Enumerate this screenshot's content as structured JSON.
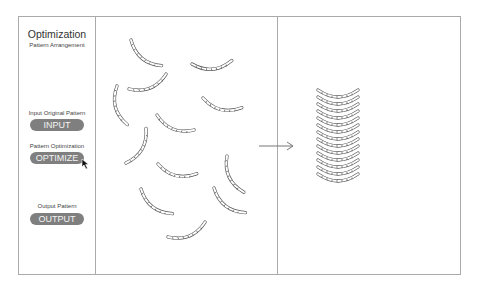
{
  "sidebar": {
    "title": "Optimization",
    "subtitle": "Pattern Arrangement",
    "steps": [
      {
        "label": "Input Original Pattern",
        "button": "INPUT"
      },
      {
        "label": "Pattern Optimization",
        "button": "OPTIMIZE"
      },
      {
        "label": "Output Pattern",
        "button": "OUTPUT"
      }
    ]
  },
  "colors": {
    "button_bg": "#7f7f7f",
    "button_text": "#f4f4f4",
    "border": "#aaaaaa",
    "pattern_stroke": "#555555"
  },
  "panels": {
    "input_piece_count": 13,
    "output_stack_count": 12
  }
}
